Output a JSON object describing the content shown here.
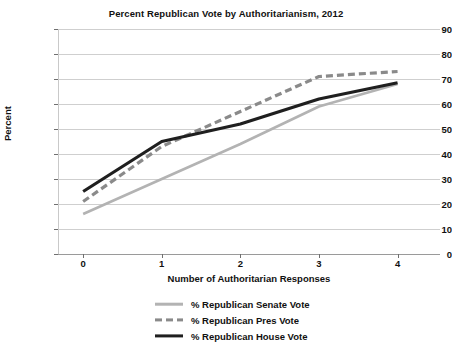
{
  "chart_data": {
    "type": "line",
    "title": "Percent Republican Vote by Authoritarianism, 2012",
    "xlabel": "Number of Authoritarian Responses",
    "ylabel": "Percent",
    "x": [
      0,
      1,
      2,
      3,
      4
    ],
    "xticklabels": [
      "0",
      "1",
      "2",
      "3",
      "4"
    ],
    "yticklabels": [
      "0",
      "10",
      "20",
      "30",
      "40",
      "50",
      "60",
      "70",
      "80",
      "90"
    ],
    "yticks": [
      0,
      10,
      20,
      30,
      40,
      50,
      60,
      70,
      80,
      90
    ],
    "xlim": [
      -0.32,
      4.54
    ],
    "ylim": [
      0,
      90
    ],
    "grid": "horizontal",
    "legend_position": "bottom",
    "series": [
      {
        "name": "% Republican Senate Vote",
        "values": [
          16,
          30,
          44,
          59,
          68
        ],
        "color": "#b3b3b3",
        "style": "solid",
        "width": 2.6
      },
      {
        "name": "% Republican Pres Vote",
        "values": [
          21,
          43,
          57,
          71,
          73
        ],
        "color": "#8a8a8a",
        "style": "dashed",
        "width": 3.2
      },
      {
        "name": "% Republican House Vote",
        "values": [
          25,
          45,
          52,
          62,
          68.5
        ],
        "color": "#1f1f1f",
        "style": "solid",
        "width": 3.2
      }
    ]
  },
  "legend": {
    "items": [
      {
        "label": "% Republican Senate Vote"
      },
      {
        "label": "% Republican Pres Vote"
      },
      {
        "label": "% Republican House Vote"
      }
    ]
  }
}
